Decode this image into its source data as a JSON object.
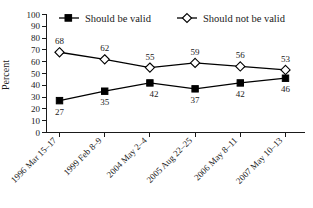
{
  "chart_data": {
    "type": "line",
    "title": "",
    "xlabel": "",
    "ylabel": "Percent",
    "ylim": [
      0,
      100
    ],
    "ytick_step": 10,
    "grid": false,
    "legend_position": "top",
    "categories": [
      "1996 Mar 15–17",
      "1999 Feb 8–9",
      "2004 May 2–4",
      "2005 Aug 22–25",
      "2006 May 8–11",
      "2007 May 10–13"
    ],
    "yticks": [
      "0",
      "10",
      "20",
      "30",
      "40",
      "50",
      "60",
      "70",
      "80",
      "90",
      "100"
    ],
    "series": [
      {
        "name": "Should be valid",
        "marker": "filled-square",
        "color": "#000000",
        "values": [
          27,
          35,
          42,
          37,
          42,
          46
        ]
      },
      {
        "name": "Should not be valid",
        "marker": "open-diamond",
        "color": "#000000",
        "values": [
          68,
          62,
          55,
          59,
          56,
          53
        ]
      }
    ]
  },
  "legend": {
    "items": [
      {
        "label": "Should be valid"
      },
      {
        "label": "Should not be valid"
      }
    ]
  },
  "axis": {
    "y_title": "Percent"
  }
}
